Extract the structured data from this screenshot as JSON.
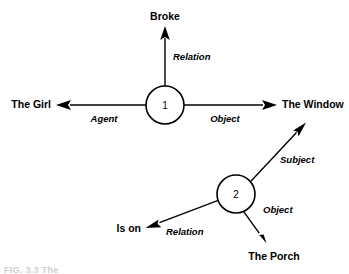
{
  "figure": {
    "background_color": "#ffffff",
    "stroke_color": "#000000",
    "caption_partial": "FIG. 3.3  The"
  },
  "nodes": [
    {
      "id": "node1",
      "label": "1",
      "cx": 165,
      "cy": 105,
      "r": 19
    },
    {
      "id": "node2",
      "label": "2",
      "cx": 236,
      "cy": 194,
      "r": 19
    }
  ],
  "entities": {
    "broke": "Broke",
    "the_girl": "The Girl",
    "the_window": "The Window",
    "is_on": "Is on",
    "the_porch": "The Porch"
  },
  "roles": {
    "relation_top": "Relation",
    "agent": "Agent",
    "object_top": "Object",
    "subject": "Subject",
    "object_bottom": "Object",
    "relation_bottom": "Relation"
  },
  "edges": [
    {
      "name": "node1-to-broke",
      "from": "node1",
      "to": "broke",
      "role": "Relation",
      "direction": "up"
    },
    {
      "name": "node1-to-the-girl",
      "from": "node1",
      "to": "the_girl",
      "role": "Agent",
      "direction": "left"
    },
    {
      "name": "node1-to-the-window",
      "from": "node1",
      "to": "the_window",
      "role": "Object",
      "direction": "right"
    },
    {
      "name": "node2-to-the-window",
      "from": "node2",
      "to": "the_window",
      "role": "Subject",
      "direction": "up-right"
    },
    {
      "name": "node2-to-the-porch",
      "from": "node2",
      "to": "the_porch",
      "role": "Object",
      "direction": "down-right"
    },
    {
      "name": "node2-to-is-on",
      "from": "node2",
      "to": "is_on",
      "role": "Relation",
      "direction": "down-left"
    }
  ]
}
